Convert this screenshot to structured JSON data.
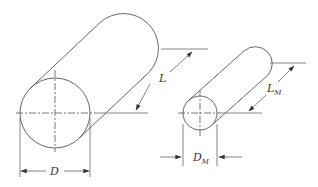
{
  "figure": {
    "prototype": {
      "length_label": "L",
      "diameter_label": "D"
    },
    "model": {
      "length_label": "L",
      "length_subscript": "M",
      "diameter_label": "D",
      "diameter_subscript": "M"
    },
    "colors": {
      "line": "#555555",
      "text": "#333333",
      "background": "#ffffff"
    }
  }
}
